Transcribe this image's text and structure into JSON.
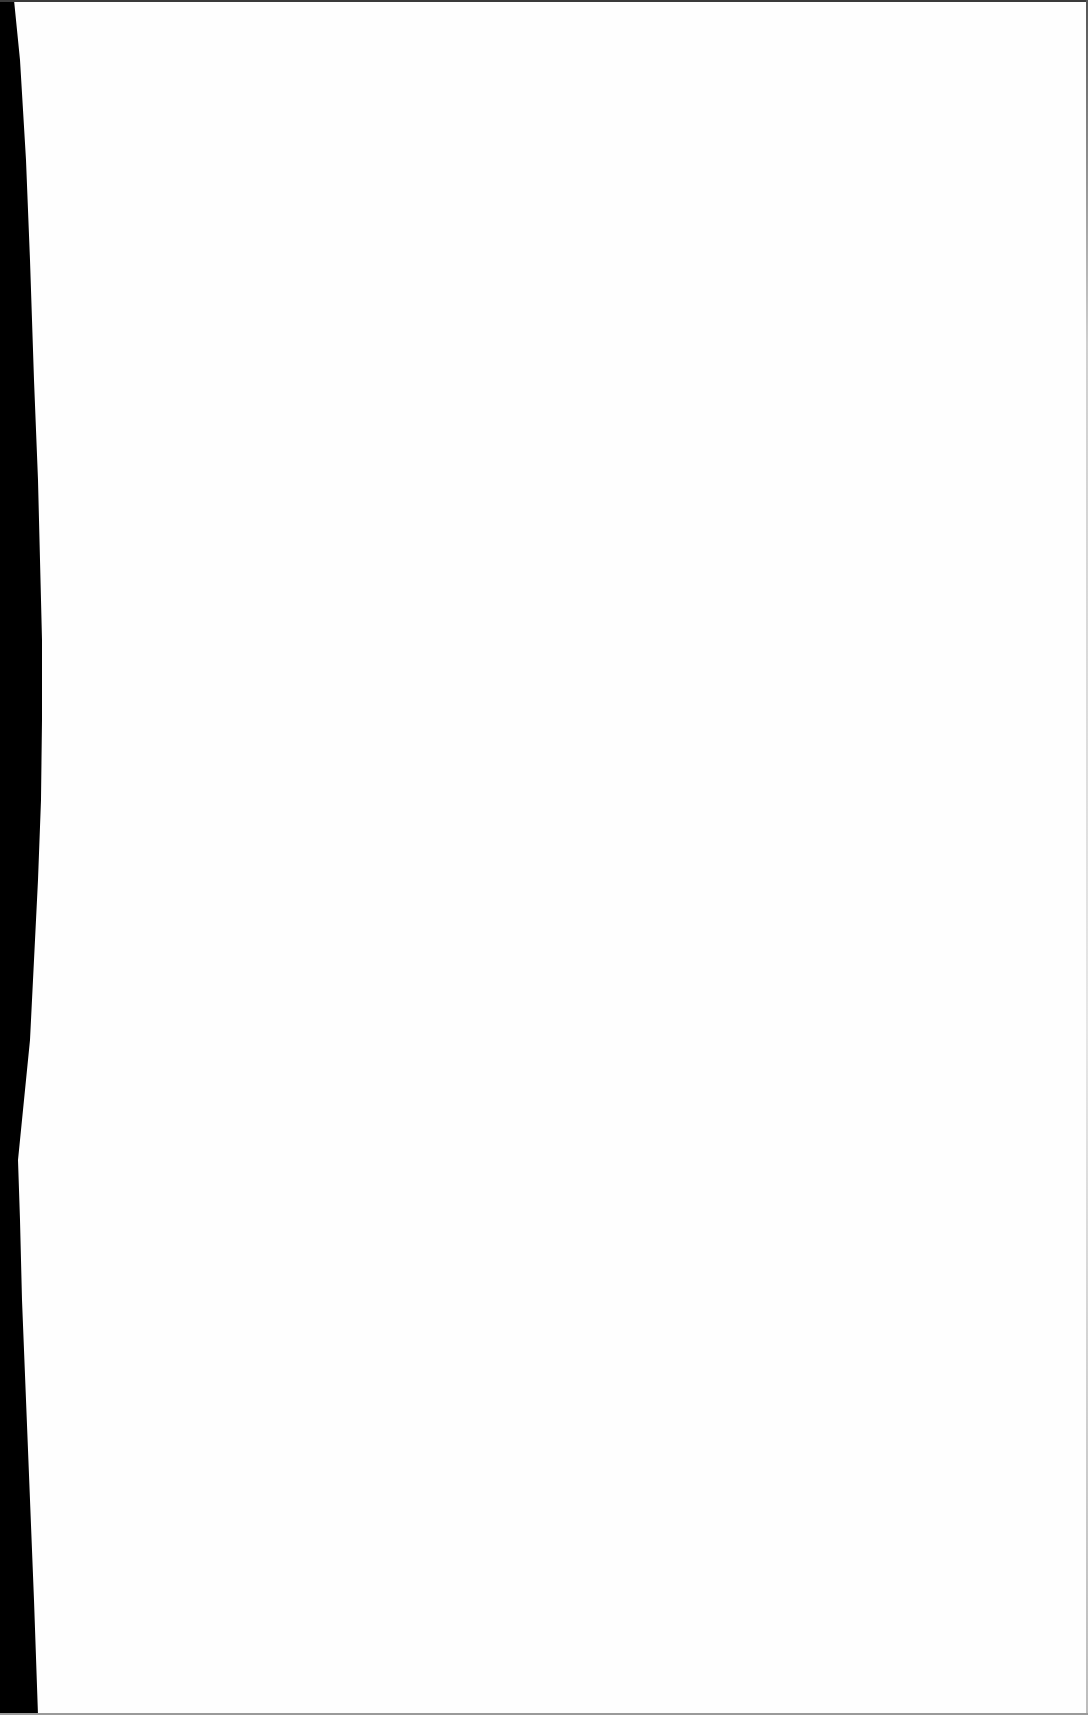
{
  "page": {
    "type": "scanned-blank-page",
    "background_color": "#fefefe",
    "scanner_edge_color": "#000000",
    "visible_text": ""
  }
}
